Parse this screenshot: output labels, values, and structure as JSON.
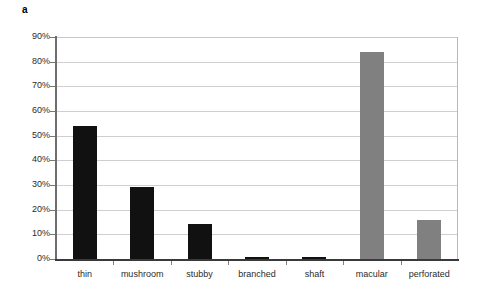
{
  "panel": {
    "label": "a"
  },
  "chart_data": {
    "type": "bar",
    "title": "",
    "subtitle": "",
    "xlabel": "",
    "ylabel": "",
    "categories": [
      "thin",
      "mushroom",
      "stubby",
      "branched",
      "shaft",
      "macular",
      "perforated"
    ],
    "values": [
      54,
      29,
      14,
      1,
      1,
      84,
      16
    ],
    "value_labels": [
      "54%",
      "29%",
      "14%",
      "1%",
      "1%",
      "84%",
      "16%"
    ],
    "bar_colors": [
      "#111111",
      "#111111",
      "#111111",
      "#111111",
      "#111111",
      "#808080",
      "#808080"
    ],
    "series": [
      {
        "name": "",
        "values": [
          54,
          29,
          14,
          1,
          1,
          84,
          16
        ]
      }
    ],
    "ylim": [
      0,
      90
    ],
    "ytick_values": [
      0,
      10,
      20,
      30,
      40,
      50,
      60,
      70,
      80,
      90
    ],
    "ytick_labels": [
      "0%",
      "10%",
      "20%",
      "30%",
      "40%",
      "50%",
      "60%",
      "70%",
      "80%",
      "90%"
    ],
    "grid": true,
    "grid_axis": "y",
    "legend": false,
    "legend_position": "none",
    "gridline_color": "#cfcfcf",
    "axis_color": "#3a3a3a",
    "background": "#ffffff"
  }
}
